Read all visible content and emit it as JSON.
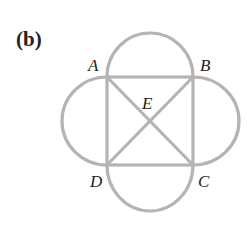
{
  "panel_label": "(b)",
  "points": {
    "A": "A",
    "B": "B",
    "C": "C",
    "D": "D",
    "E": "E"
  },
  "colors": {
    "stroke": "#b4b4b4",
    "text": "#222222"
  }
}
